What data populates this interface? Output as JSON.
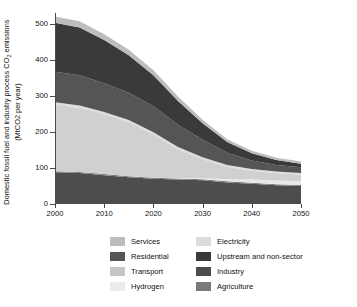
{
  "chart_data": {
    "type": "area",
    "stacked": true,
    "title": "",
    "xlabel": "",
    "ylabel": "Domestic fossil fuel and industry process CO2 emissions (MtCO2 per year)",
    "ylabel_line1": "Domestic fossil fuel and industry process CO",
    "ylabel_sub": "2",
    "ylabel_line1_tail": " emissions",
    "ylabel_line2": "(MtCO2 per year)",
    "xlim": [
      2000,
      2050
    ],
    "ylim": [
      0,
      530
    ],
    "xticks": [
      2000,
      2010,
      2020,
      2030,
      2040,
      2050
    ],
    "yticks": [
      0,
      100,
      200,
      300,
      400,
      500
    ],
    "grid": "horizontal-right-extension",
    "legend_position": "bottom",
    "x": [
      2000,
      2005,
      2010,
      2015,
      2020,
      2025,
      2030,
      2035,
      2040,
      2045,
      2050
    ],
    "series": [
      {
        "name": "Industry",
        "color": "#4d4d4d",
        "values": [
          88,
          86,
          80,
          74,
          70,
          68,
          66,
          60,
          56,
          52,
          50
        ]
      },
      {
        "name": "Agriculture",
        "color": "#7a7a7a",
        "values": [
          3,
          3,
          3,
          3,
          3,
          3,
          3,
          3,
          3,
          3,
          3
        ]
      },
      {
        "name": "Hydrogen",
        "color": "#e8e8e8",
        "values": [
          0,
          0,
          0,
          0,
          0,
          1,
          3,
          6,
          9,
          10,
          10
        ]
      },
      {
        "name": "Transport",
        "color": "#d0d0d0",
        "values": [
          185,
          178,
          166,
          150,
          120,
          80,
          52,
          34,
          24,
          20,
          18
        ]
      },
      {
        "name": "Electricity",
        "color": "#dcdcdc",
        "values": [
          6,
          6,
          6,
          6,
          6,
          6,
          6,
          5,
          5,
          5,
          5
        ]
      },
      {
        "name": "Residential",
        "color": "#555555",
        "values": [
          85,
          84,
          80,
          76,
          72,
          62,
          48,
          34,
          24,
          18,
          16
        ]
      },
      {
        "name": "Upstream and non-sector",
        "color": "#3a3a3a",
        "values": [
          136,
          133,
          120,
          104,
          86,
          66,
          46,
          30,
          20,
          14,
          10
        ]
      },
      {
        "name": "Services",
        "color": "#bdbdbd",
        "values": [
          17,
          17,
          16,
          15,
          14,
          12,
          10,
          8,
          7,
          6,
          6
        ]
      }
    ],
    "stack_order_bottom_to_top": [
      "Industry",
      "Agriculture",
      "Hydrogen",
      "Transport",
      "Electricity",
      "Residential",
      "Upstream and non-sector",
      "Services"
    ],
    "totals": [
      520,
      507,
      471,
      428,
      371,
      298,
      234,
      180,
      148,
      128,
      118
    ]
  },
  "legend": {
    "items": [
      {
        "label": "Services",
        "color": "#bdbdbd"
      },
      {
        "label": "Electricity",
        "color": "#dcdcdc"
      },
      {
        "label": "Residential",
        "color": "#555555"
      },
      {
        "label": "Upstream and non-sector",
        "color": "#3a3a3a"
      },
      {
        "label": "Transport",
        "color": "#c6c6c6"
      },
      {
        "label": "Industry",
        "color": "#4d4d4d"
      },
      {
        "label": "Hydrogen",
        "color": "#ebebeb"
      },
      {
        "label": "Agriculture",
        "color": "#7a7a7a"
      }
    ]
  },
  "axes": {
    "xticks": [
      "2000",
      "2010",
      "2020",
      "2030",
      "2040",
      "2050"
    ],
    "yticks": [
      "0",
      "100",
      "200",
      "300",
      "400",
      "500"
    ]
  }
}
